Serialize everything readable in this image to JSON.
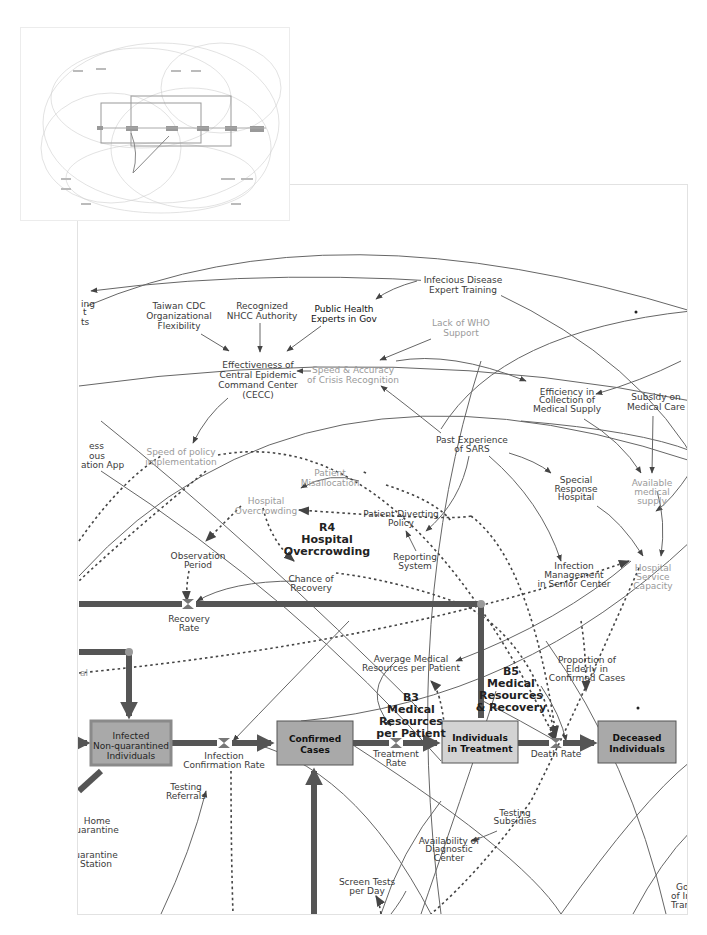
{
  "thumbnail": {
    "label": "overview-minimap"
  },
  "diagram": {
    "nodes": {
      "infectious_training": [
        "Infecious Disease",
        "Expert Training"
      ],
      "taiwan_cdc": [
        "Taiwan CDC",
        "Organizational",
        "Flexibility"
      ],
      "nhcc": [
        "Recognized",
        "NHCC Authority"
      ],
      "public_health": [
        "Public Health",
        "Experts in Gov"
      ],
      "lack_who": [
        "Lack of WHO",
        "Support"
      ],
      "cecc": [
        "Effectiveness of",
        "Central Epidemic",
        "Command Center",
        "(CECC)"
      ],
      "speed_accuracy": [
        "Speed & Accuracy",
        "of Crisis Recognition"
      ],
      "efficiency_supply": [
        "Efficiency in",
        "Collection of",
        "Medical Supply"
      ],
      "subsidy_care": [
        "Subsidy on",
        "Medical Care"
      ],
      "speed_policy": [
        "Speed of policy",
        "implementation"
      ],
      "past_sars": [
        "Past Experience",
        "of SARS"
      ],
      "left_app": [
        "ess",
        "ous",
        "ation App"
      ],
      "left_ing": [
        "ing",
        "t",
        "ts"
      ],
      "patient_misallocation": [
        "Patient",
        "Misallocation"
      ],
      "hospital_overcrowding": [
        "Hospital",
        "Overcrowding"
      ],
      "patient_diverting": [
        "Patient Diverting",
        "Policy"
      ],
      "special_response": [
        "Special",
        "Response",
        "Hospital"
      ],
      "available_supply": [
        "Available",
        "medical",
        "supply"
      ],
      "observation_period": [
        "Observation",
        "Period"
      ],
      "reporting_system": [
        "Reporting",
        "System"
      ],
      "infection_mgmt": [
        "Infection",
        "Management",
        "in Senior Center"
      ],
      "hospital_capacity": [
        "Hospital",
        "Service",
        "Capacity"
      ],
      "chance_recovery": [
        "Chance of",
        "Recovery"
      ],
      "recovery_rate": [
        "Recovery",
        "Rate"
      ],
      "avg_resources": [
        "Average Medical",
        "Resources per Patient"
      ],
      "elderly": [
        "Proportion of",
        "Elderly in",
        "Confirmed Cases"
      ],
      "infection_conf_rate": [
        "Infection",
        "Confirmation Rate"
      ],
      "treatment_rate": [
        "Treatment",
        "Rate"
      ],
      "death_rate": [
        "Death Rate"
      ],
      "testing_referrals": [
        "Testing",
        "Referrals"
      ],
      "home_quarantine": [
        "Home",
        "uarantine"
      ],
      "quarantine_station": [
        "uarantine",
        "Station"
      ],
      "testing_subsidies": [
        "Testing",
        "Subsidies"
      ],
      "diagnostic_center": [
        "Availability of",
        "Diagnostic",
        "Center"
      ],
      "screen_tests": [
        "Screen Tests",
        "per Day"
      ],
      "gov_edge": [
        "Gov",
        "of In",
        "Tran"
      ],
      "left_al": [
        "al"
      ]
    },
    "stocks": {
      "infected": [
        "Infected",
        "Non-quarantined",
        "Individuals"
      ],
      "confirmed": [
        "Confirmed",
        "Cases"
      ],
      "treatment": [
        "Individuals",
        "in Treatment"
      ],
      "deceased": [
        "Deceased",
        "Individuals"
      ]
    },
    "loops": {
      "r4": [
        "R4",
        "Hospital",
        "Overcrowding"
      ],
      "b3": [
        "B3",
        "Medical",
        "Resources",
        "per Patient"
      ],
      "b5": [
        "B5",
        "Medical",
        "Resources",
        "& Recovery"
      ]
    },
    "colors": {
      "stock_fill": "#a9a9a9",
      "stock_light": "#d3d3d3",
      "pipe": "#555555",
      "stock_border_infected": "#8a8a8a"
    }
  }
}
